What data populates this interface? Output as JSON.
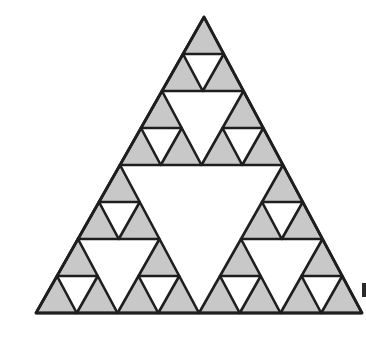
{
  "figure": {
    "iteration_depth": 3,
    "filled_triangle_count": 27,
    "outer_triangle": {
      "apex": [
        204,
        17
      ],
      "bottom_left": [
        36,
        313
      ],
      "bottom_right": [
        362,
        313
      ]
    },
    "colors": {
      "background": "#ffffff",
      "fill": "#c8c8c8",
      "stroke": "#1e1e1e"
    }
  }
}
